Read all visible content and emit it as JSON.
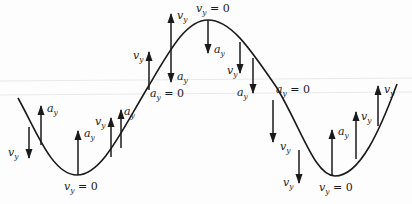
{
  "diagram": {
    "type": "kinematics-sine-wave",
    "colors": {
      "ink": "#1a1a1a",
      "background": "#fdfdfd",
      "scanline": "#e6e6e6"
    },
    "labels": {
      "vy": "v",
      "ay": "a",
      "sub_y": "y",
      "eq_zero": " = 0"
    },
    "annotations": [
      {
        "id": "vy0-left-min",
        "text": "v_y = 0",
        "x": 64,
        "y": 190
      },
      {
        "id": "vy0-peak",
        "text": "v_y = 0",
        "x": 196,
        "y": 12
      },
      {
        "id": "ay0-left-inflection",
        "text": "a_y = 0",
        "x": 150,
        "y": 97
      },
      {
        "id": "ay0-right-inflection",
        "text": "a_y = 0",
        "x": 276,
        "y": 93
      },
      {
        "id": "vy0-right-min",
        "text": "v_y = 0",
        "x": 319,
        "y": 191
      }
    ],
    "vectors": [
      {
        "id": "v1",
        "kind": "v_y",
        "dir": "down",
        "x": 29,
        "y1": 127,
        "y2": 158,
        "label_x": 8,
        "label_y": 156
      },
      {
        "id": "a1",
        "kind": "a_y",
        "dir": "up",
        "x": 41,
        "y1": 145,
        "y2": 106,
        "label_x": 47,
        "label_y": 112
      },
      {
        "id": "a2",
        "kind": "a_y",
        "dir": "up",
        "x": 78,
        "y1": 175,
        "y2": 131,
        "label_x": 84,
        "label_y": 137
      },
      {
        "id": "v2",
        "kind": "v_y",
        "dir": "up",
        "x": 111,
        "y1": 157,
        "y2": 118,
        "label_x": 95,
        "label_y": 125
      },
      {
        "id": "a3",
        "kind": "a_y",
        "dir": "up",
        "x": 121,
        "y1": 148,
        "y2": 110,
        "label_x": 124,
        "label_y": 115
      },
      {
        "id": "v3",
        "kind": "v_y",
        "dir": "up",
        "x": 149,
        "y1": 90,
        "y2": 52,
        "label_x": 133,
        "label_y": 59
      },
      {
        "id": "v4",
        "kind": "v_y",
        "dir": "up",
        "x": 171,
        "y1": 49,
        "y2": 14,
        "label_x": 177,
        "label_y": 19
      },
      {
        "id": "a4",
        "kind": "a_y",
        "dir": "down",
        "x": 171,
        "y1": 49,
        "y2": 82,
        "label_x": 177,
        "label_y": 80
      },
      {
        "id": "a5",
        "kind": "a_y",
        "dir": "down",
        "x": 208,
        "y1": 20,
        "y2": 53,
        "label_x": 214,
        "label_y": 53
      },
      {
        "id": "v5",
        "kind": "v_y",
        "dir": "down",
        "x": 240,
        "y1": 42,
        "y2": 73,
        "label_x": 227,
        "label_y": 74
      },
      {
        "id": "a6",
        "kind": "a_y",
        "dir": "down",
        "x": 253,
        "y1": 58,
        "y2": 93,
        "label_x": 237,
        "label_y": 96
      },
      {
        "id": "v6",
        "kind": "v_y",
        "dir": "down",
        "x": 273,
        "y1": 100,
        "y2": 142,
        "label_x": 280,
        "label_y": 150
      },
      {
        "id": "v7",
        "kind": "v_y",
        "dir": "down",
        "x": 299,
        "y1": 150,
        "y2": 183,
        "label_x": 283,
        "label_y": 186
      },
      {
        "id": "a7",
        "kind": "a_y",
        "dir": "up",
        "x": 332,
        "y1": 176,
        "y2": 130,
        "label_x": 338,
        "label_y": 135
      },
      {
        "id": "v8",
        "kind": "v_y",
        "dir": "up",
        "x": 356,
        "y1": 159,
        "y2": 112,
        "label_x": 361,
        "label_y": 120
      },
      {
        "id": "v9",
        "kind": "v_y",
        "dir": "up",
        "x": 378,
        "y1": 126,
        "y2": 86,
        "label_x": 384,
        "label_y": 93
      }
    ]
  }
}
